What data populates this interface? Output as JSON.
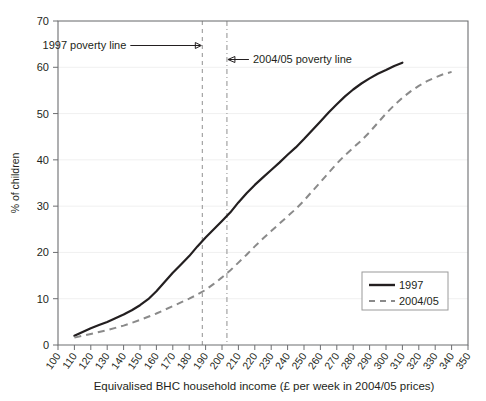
{
  "chart_data": {
    "type": "line",
    "title": "",
    "xlabel": "Equivalised BHC household income (£ per week in 2004/05 prices)",
    "ylabel": "% of children",
    "xlim": [
      100,
      350
    ],
    "ylim": [
      0,
      70
    ],
    "xticks": [
      100,
      110,
      120,
      130,
      140,
      150,
      160,
      170,
      180,
      190,
      200,
      210,
      220,
      230,
      240,
      250,
      260,
      270,
      280,
      290,
      300,
      310,
      320,
      330,
      340,
      350
    ],
    "yticks": [
      0,
      10,
      20,
      30,
      40,
      50,
      60,
      70
    ],
    "grid": "horizontal-faint",
    "legend_position": "bottom-right",
    "series": [
      {
        "name": "1997",
        "color": "#231f20",
        "style": "solid",
        "x": [
          110,
          115,
          120,
          125,
          130,
          135,
          140,
          145,
          150,
          155,
          160,
          165,
          170,
          175,
          180,
          185,
          190,
          195,
          200,
          205,
          210,
          215,
          220,
          225,
          230,
          235,
          240,
          245,
          250,
          255,
          260,
          265,
          270,
          275,
          280,
          285,
          290,
          295,
          300,
          305,
          310
        ],
        "y": [
          2.0,
          2.8,
          3.6,
          4.3,
          5.0,
          5.8,
          6.6,
          7.5,
          8.6,
          9.9,
          11.6,
          13.6,
          15.6,
          17.4,
          19.2,
          21.3,
          23.2,
          25.0,
          26.8,
          28.6,
          30.8,
          32.8,
          34.6,
          36.2,
          37.8,
          39.4,
          41.1,
          42.7,
          44.5,
          46.4,
          48.3,
          50.2,
          52.0,
          53.7,
          55.2,
          56.5,
          57.6,
          58.6,
          59.4,
          60.3,
          61.0
        ]
      },
      {
        "name": "2004/05",
        "color": "#8a8a8a",
        "style": "dashed",
        "x": [
          110,
          115,
          120,
          125,
          130,
          135,
          140,
          145,
          150,
          155,
          160,
          165,
          170,
          175,
          180,
          185,
          190,
          195,
          200,
          205,
          210,
          215,
          220,
          225,
          230,
          235,
          240,
          245,
          250,
          255,
          260,
          265,
          270,
          275,
          280,
          285,
          290,
          295,
          300,
          305,
          310,
          315,
          320,
          325,
          330,
          335,
          340
        ],
        "y": [
          1.6,
          2.0,
          2.4,
          2.8,
          3.2,
          3.7,
          4.2,
          4.8,
          5.4,
          6.1,
          6.8,
          7.6,
          8.4,
          9.2,
          10.0,
          10.9,
          11.9,
          13.2,
          14.6,
          16.1,
          17.8,
          19.5,
          21.3,
          23.0,
          24.6,
          26.2,
          27.8,
          29.4,
          31.2,
          33.2,
          35.2,
          37.2,
          39.2,
          41.0,
          42.6,
          44.2,
          46.0,
          48.0,
          50.0,
          51.8,
          53.4,
          54.8,
          56.0,
          57.0,
          57.8,
          58.5,
          59.0
        ]
      }
    ],
    "annotations": [
      {
        "id": "poverty-line-1997",
        "label": "1997 poverty line",
        "x_value": 188,
        "arrow": "right"
      },
      {
        "id": "poverty-line-200405",
        "label": "2004/05 poverty line",
        "x_value": 203,
        "arrow": "left"
      }
    ]
  }
}
